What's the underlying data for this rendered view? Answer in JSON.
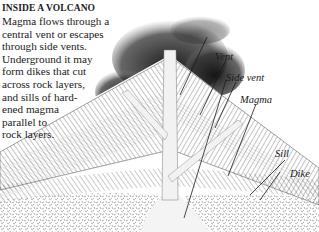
{
  "caption": {
    "title": "INSIDE A VOLCANO",
    "lines": [
      "Magma flows through a",
      "central vent or escapes",
      "through side vents.",
      "Underground it may",
      "form dikes that cut",
      "across rock layers,",
      "and sills of hard-",
      "ened magma",
      "parallel  to",
      "rock layers."
    ]
  },
  "labels": {
    "vent": "Vent",
    "side_vent": "Side vent",
    "magma": "Magma",
    "sill": "Sill",
    "dike": "Dike"
  },
  "colors": {
    "ink": "#1a1a1a",
    "background": "#ffffff",
    "smoke": "#2a2a2a",
    "layer_hatch": "#555555"
  }
}
